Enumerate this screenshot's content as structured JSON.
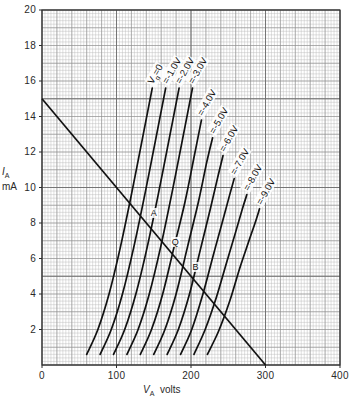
{
  "chart_data": {
    "type": "line",
    "title": "",
    "xlabel": "V_A volts",
    "ylabel": "I_A mA",
    "xlim": [
      0,
      400
    ],
    "ylim": [
      0,
      20
    ],
    "grid": true,
    "xticks": [
      0,
      100,
      200,
      300,
      400
    ],
    "yticks": [
      2,
      4,
      6,
      8,
      10,
      12,
      14,
      16,
      18,
      20
    ],
    "legend_position": "inline-curve-labels",
    "series": [
      {
        "name": "Vg=0",
        "label": "V<span class=\"sub\">g</span>=0",
        "points": [
          [
            60,
            0.6
          ],
          [
            75,
            2.0
          ],
          [
            90,
            4.0
          ],
          [
            105,
            6.6
          ],
          [
            120,
            9.6
          ],
          [
            135,
            12.8
          ],
          [
            148,
            15.6
          ]
        ]
      },
      {
        "name": "-1.0V",
        "label": "=-1.0V",
        "points": [
          [
            78,
            0.6
          ],
          [
            93,
            2.0
          ],
          [
            108,
            4.0
          ],
          [
            123,
            6.6
          ],
          [
            138,
            9.6
          ],
          [
            153,
            12.8
          ],
          [
            166,
            15.6
          ]
        ]
      },
      {
        "name": "-2.0V",
        "label": "=-2.0V",
        "points": [
          [
            96,
            0.6
          ],
          [
            111,
            2.0
          ],
          [
            126,
            4.0
          ],
          [
            141,
            6.6
          ],
          [
            156,
            9.6
          ],
          [
            171,
            12.8
          ],
          [
            184,
            15.6
          ]
        ]
      },
      {
        "name": "-3.0V",
        "label": "=-3.0V",
        "points": [
          [
            114,
            0.6
          ],
          [
            129,
            2.0
          ],
          [
            144,
            4.0
          ],
          [
            159,
            6.6
          ],
          [
            174,
            9.6
          ],
          [
            189,
            12.8
          ],
          [
            202,
            15.6
          ]
        ]
      },
      {
        "name": "-4.0V",
        "label": "=-4.0V",
        "points": [
          [
            132,
            0.6
          ],
          [
            147,
            2.0
          ],
          [
            162,
            4.0
          ],
          [
            177,
            6.6
          ],
          [
            192,
            9.2
          ],
          [
            205,
            11.9
          ],
          [
            214,
            13.8
          ]
        ]
      },
      {
        "name": "-5.0V",
        "label": "=-5.0V",
        "points": [
          [
            150,
            0.6
          ],
          [
            165,
            2.0
          ],
          [
            180,
            4.0
          ],
          [
            195,
            6.6
          ],
          [
            210,
            9.2
          ],
          [
            221,
            11.4
          ],
          [
            229,
            12.8
          ]
        ]
      },
      {
        "name": "-6.0V",
        "label": "=-6.0V",
        "points": [
          [
            168,
            0.6
          ],
          [
            183,
            2.0
          ],
          [
            198,
            4.0
          ],
          [
            212,
            6.4
          ],
          [
            226,
            8.8
          ],
          [
            236,
            10.6
          ],
          [
            243,
            11.8
          ]
        ]
      },
      {
        "name": "-7.0V",
        "label": "=-7.0V",
        "points": [
          [
            186,
            0.6
          ],
          [
            201,
            2.0
          ],
          [
            216,
            4.0
          ],
          [
            230,
            6.2
          ],
          [
            243,
            8.2
          ],
          [
            252,
            9.6
          ],
          [
            258,
            10.5
          ]
        ]
      },
      {
        "name": "-8.0V",
        "label": "=-8.0V",
        "points": [
          [
            204,
            0.6
          ],
          [
            219,
            2.0
          ],
          [
            234,
            3.8
          ],
          [
            248,
            5.8
          ],
          [
            260,
            7.5
          ],
          [
            269,
            8.8
          ],
          [
            275,
            9.6
          ]
        ]
      },
      {
        "name": "-9.0V",
        "label": "=-9.0V",
        "points": [
          [
            222,
            0.6
          ],
          [
            237,
            1.9
          ],
          [
            252,
            3.6
          ],
          [
            265,
            5.4
          ],
          [
            277,
            6.9
          ],
          [
            286,
            8.0
          ],
          [
            292,
            8.8
          ]
        ]
      }
    ],
    "load_line": {
      "name": "load-line",
      "points": [
        [
          0,
          15
        ],
        [
          300,
          0
        ]
      ]
    },
    "annotations": [
      {
        "name": "A",
        "text": "A",
        "x": 142,
        "y": 8.2
      },
      {
        "name": "Q",
        "text": "Q",
        "x": 170,
        "y": 6.6
      },
      {
        "name": "B",
        "text": "B",
        "x": 198,
        "y": 5.2
      }
    ]
  },
  "axes": {
    "x_label_symbol": "V",
    "x_label_sub": "A",
    "x_label_unit": "volts",
    "y_label_symbol": "I",
    "y_label_sub": "A",
    "y_label_unit": "mA"
  },
  "colors": {
    "curve": "#111111",
    "grid_minor": "#b9b9b9",
    "grid_major": "#6e6e6e",
    "axis": "#2b2b2b",
    "background": "#ffffff"
  }
}
